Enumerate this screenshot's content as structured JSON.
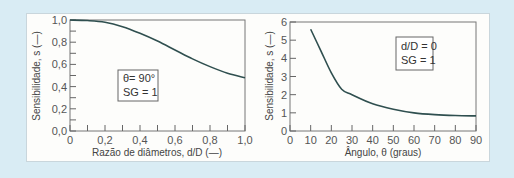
{
  "chart_data": [
    {
      "type": "line",
      "title": "",
      "xlabel": "Razão de diâmetros, d/D (—)",
      "ylabel": "Sensibilidade, s (—)",
      "xlim": [
        0,
        1.0
      ],
      "ylim": [
        0,
        1.0
      ],
      "x_ticks": [
        "0",
        "0,2",
        "0,4",
        "0,6",
        "0,8",
        "1,0"
      ],
      "y_ticks": [
        "0,0",
        "0,2",
        "0,4",
        "0,6",
        "0,8",
        "1,0"
      ],
      "annotation": [
        "θ = 90°",
        "SG = 1"
      ],
      "grid": false,
      "x": [
        0,
        0.1,
        0.2,
        0.3,
        0.4,
        0.5,
        0.6,
        0.7,
        0.8,
        0.9,
        1.0
      ],
      "y": [
        1.0,
        0.995,
        0.98,
        0.94,
        0.88,
        0.81,
        0.73,
        0.65,
        0.58,
        0.52,
        0.48
      ]
    },
    {
      "type": "line",
      "title": "",
      "xlabel": "Ângulo, θ (graus)",
      "ylabel": "Sensibilidade, s (—)",
      "xlim": [
        0,
        90
      ],
      "ylim": [
        0,
        6
      ],
      "x_ticks": [
        "0",
        "10",
        "20",
        "30",
        "40",
        "50",
        "60",
        "70",
        "80",
        "90"
      ],
      "y_ticks": [
        "0",
        "1",
        "2",
        "3",
        "4",
        "5",
        "6"
      ],
      "annotation": [
        "d/D = 0",
        "SG = 1"
      ],
      "grid": false,
      "x": [
        10,
        15,
        20,
        25,
        30,
        40,
        50,
        60,
        70,
        80,
        90
      ],
      "y": [
        5.6,
        4.4,
        3.2,
        2.3,
        2.0,
        1.5,
        1.2,
        1.0,
        0.9,
        0.85,
        0.83
      ]
    }
  ],
  "left": {
    "xlabel": "Razão de diâmetros, d/D (—)",
    "ylabel": "Sensibilidade, s (—)",
    "x_ticks": [
      "0",
      "0,2",
      "0,4",
      "0,6",
      "0,8",
      "1,0"
    ],
    "y_ticks": [
      "0,0",
      "0,2",
      "0,4",
      "0,6",
      "0,8",
      "1,0"
    ],
    "legend_line1": "θ= 90°",
    "legend_line2": "SG = 1"
  },
  "right": {
    "xlabel": "Ângulo, θ (graus)",
    "ylabel": "Sensibilidade, s (—)",
    "x_ticks": [
      "0",
      "10",
      "20",
      "30",
      "40",
      "50",
      "60",
      "70",
      "80",
      "90"
    ],
    "y_ticks": [
      "0",
      "1",
      "2",
      "3",
      "4",
      "5",
      "6"
    ],
    "legend_line1": "d/D = 0",
    "legend_line2": "SG = 1"
  },
  "colors": {
    "curve": "#2f4f4f",
    "axis": "#666666",
    "background": "#d9ecf4",
    "panel": "#fdfdfb"
  }
}
